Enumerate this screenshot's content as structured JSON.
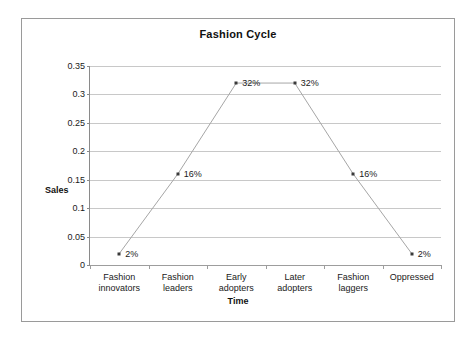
{
  "chart_data": {
    "type": "line",
    "title": "Fashion Cycle",
    "xlabel": "Time",
    "ylabel": "Sales",
    "categories": [
      "Fashion\ninnovators",
      "Fashion\nleaders",
      "Early\nadopters",
      "Later\nadopters",
      "Fashion\nlaggers",
      "Oppressed"
    ],
    "values": [
      0.02,
      0.16,
      0.32,
      0.32,
      0.16,
      0.02
    ],
    "point_labels": [
      "2%",
      "16%",
      "32%",
      "32%",
      "16%",
      "2%"
    ],
    "ylim": [
      0,
      0.35
    ],
    "yticks": [
      0,
      0.05,
      0.1,
      0.15,
      0.2,
      0.25,
      0.3,
      0.35
    ],
    "ytick_labels": [
      "0",
      "0.05",
      "0.1",
      "0.15",
      "0.2",
      "0.25",
      "0.3",
      "0.35"
    ],
    "grid": true,
    "legend": false,
    "series_color": "#a6a6a6",
    "marker_color": "#3a3a3a",
    "gridline_color": "#c8c8c8",
    "frame_color": "#9a9a9a"
  }
}
